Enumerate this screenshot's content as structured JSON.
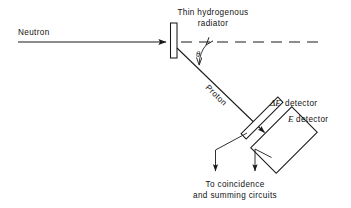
{
  "figure": {
    "type": "schematic-diagram",
    "background_color": "#ffffff",
    "line_color": "#1a1a1a"
  },
  "labels": {
    "neutron": "Neutron",
    "radiator_line1": "Thin  hydrogenous",
    "radiator_line2": "radiator",
    "theta": "θ",
    "proton": "Proton",
    "delta_e_symbol": "ΔE",
    "delta_e_detector": "detector",
    "e_symbol": "E",
    "e_detector": "detector",
    "output_line1": "To  coincidence",
    "output_line2": "and  summing  circuits"
  },
  "geometry": {
    "neutron_beam": {
      "x1": 18,
      "y1": 42,
      "x2": 170,
      "y2": 42
    },
    "radiator_rect": {
      "x": 170.5,
      "y": 23,
      "width": 6.5,
      "height": 35
    },
    "axis_dashed": {
      "x1": 181,
      "y1": 42,
      "x2": 322,
      "y2": 42
    },
    "proton_ray": {
      "x1": 177,
      "y1": 48,
      "x2": 268,
      "y2": 136
    },
    "theta_arc_radius": 30,
    "delta_e_detector_bar": {
      "cx": 262,
      "cy": 119,
      "length": 52,
      "thickness": 7,
      "angle_deg": -45
    },
    "e_detector_box": {
      "cx": 285,
      "cy": 140,
      "width": 58,
      "height": 36,
      "angle_deg": -45
    },
    "lead_delta_e": [
      [
        248,
        134
      ],
      [
        215,
        150
      ],
      [
        215,
        176
      ]
    ],
    "lead_e": [
      [
        272,
        157
      ],
      [
        255,
        150
      ],
      [
        255,
        176
      ]
    ]
  },
  "colors": {
    "ink": "#1a1a1a",
    "paper": "#ffffff"
  }
}
